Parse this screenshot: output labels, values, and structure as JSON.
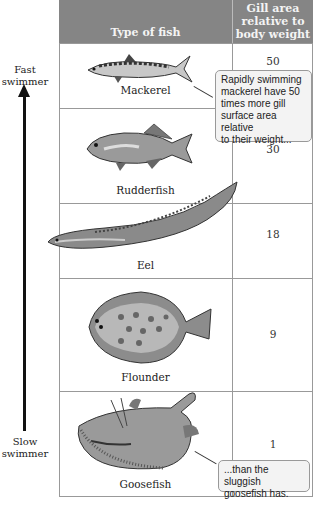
{
  "side_labels": {
    "top": [
      "Fast",
      "swimmer"
    ],
    "bottom": [
      "Slow",
      "swimmer"
    ]
  },
  "header": {
    "col1": "Type of fish",
    "col2": [
      "Gill area",
      "relative to",
      "body weight"
    ]
  },
  "rows": [
    {
      "name": "Mackerel",
      "value": "50",
      "icon": "mackerel-illustration"
    },
    {
      "name": "Rudderfish",
      "value": "30",
      "icon": "rudderfish-illustration"
    },
    {
      "name": "Eel",
      "value": "18",
      "icon": "eel-illustration"
    },
    {
      "name": "Flounder",
      "value": "9",
      "icon": "flounder-illustration"
    },
    {
      "name": "Goosefish",
      "value": "1",
      "icon": "goosefish-illustration"
    }
  ],
  "callouts": {
    "top": [
      "Rapidly swimming",
      "mackerel have 50",
      "times more gill",
      "surface area relative",
      "to their weight..."
    ],
    "bottom": [
      "...than the sluggish",
      "goosefish has."
    ]
  },
  "colors": {
    "header_bg": "#858585",
    "grid": "#999999",
    "callout_bg": "#f3f3f3"
  }
}
